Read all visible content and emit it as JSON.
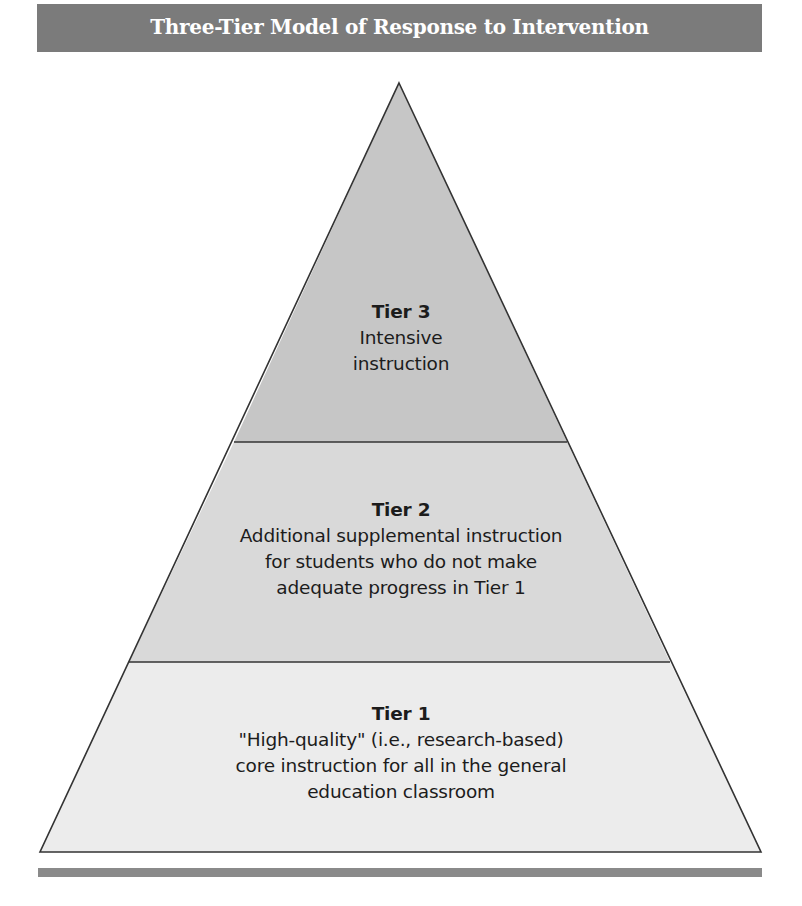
{
  "header": {
    "title": "Three-Tier Model of Response to Intervention",
    "background_color": "#7b7b7b"
  },
  "pyramid": {
    "outline_color": "#333333",
    "tiers": [
      {
        "level": "tier-3",
        "heading": "Tier 3",
        "lines": [
          "Intensive",
          "instruction"
        ],
        "fill_color": "#c6c6c6"
      },
      {
        "level": "tier-2",
        "heading": "Tier 2",
        "lines": [
          "Additional supplemental instruction",
          "for students who do not make",
          "adequate progress in Tier 1"
        ],
        "fill_color": "#d9d9d9"
      },
      {
        "level": "tier-1",
        "heading": "Tier 1",
        "lines": [
          "\"High-quality\" (i.e., research-based)",
          "core instruction for all in the general",
          "education classroom"
        ],
        "fill_color": "#ececec"
      }
    ]
  },
  "footer": {
    "rule_color": "#8a8a8a"
  }
}
